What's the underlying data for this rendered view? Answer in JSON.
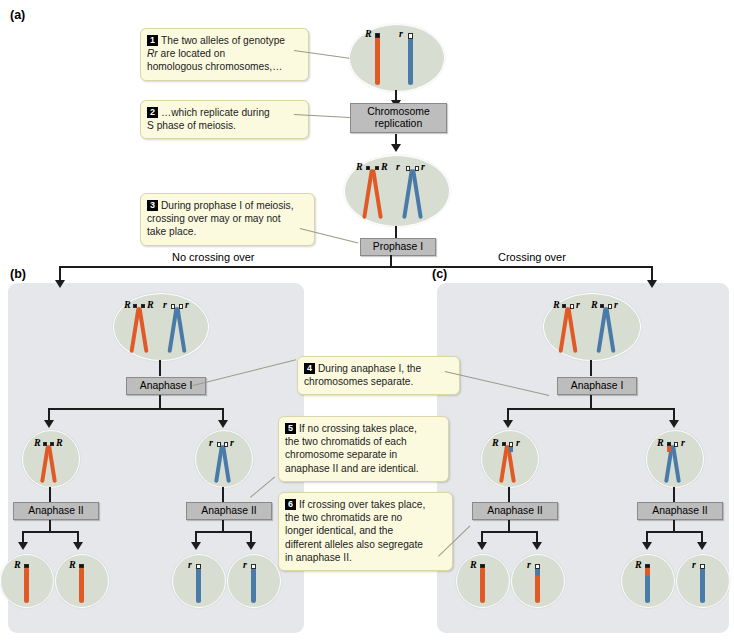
{
  "figure": {
    "sections": [
      {
        "id": "a",
        "label": "(a)"
      },
      {
        "id": "b",
        "label": "(b)"
      },
      {
        "id": "c",
        "label": "(c)"
      }
    ],
    "branch_labels": {
      "left": "No crossing over",
      "right": "Crossing over"
    },
    "stages": {
      "chromosome_replication": "Chromosome\nreplication",
      "chromosome_replication_line1": "Chromosome",
      "chromosome_replication_line2": "replication",
      "prophase_1": "Prophase I",
      "anaphase_1": "Anaphase I",
      "anaphase_2": "Anaphase II"
    },
    "callouts": [
      {
        "num": "1",
        "lines": [
          "The two alleles of genotype",
          "Rr are located on",
          "homologous chromosomes,…"
        ],
        "italic_token": "Rr"
      },
      {
        "num": "2",
        "lines": [
          "…which replicate during",
          "S phase of meiosis."
        ]
      },
      {
        "num": "3",
        "lines": [
          "During prophase I of meiosis,",
          "crossing over may or may not",
          "take place."
        ]
      },
      {
        "num": "4",
        "lines": [
          "During anaphase I, the",
          "chromosomes separate."
        ]
      },
      {
        "num": "5",
        "lines": [
          "If no crossing takes place,",
          "the two chromatids of each",
          "chromosome separate in",
          "anaphase II and are identical."
        ]
      },
      {
        "num": "6",
        "lines": [
          "If crossing over takes place,",
          "the two chromatids are no",
          "longer identical, and the",
          "different alleles also segregate",
          "in anaphase II."
        ]
      }
    ],
    "alleles": {
      "dominant": "R",
      "recessive": "r"
    },
    "colors": {
      "chromosome_orange": "#e05a28",
      "chromosome_blue": "#4a7ba8",
      "cell_fill": "#d7ddd0",
      "panel_fill": "#e6e7eb",
      "callout_fill": "#fbfadf",
      "stage_fill": "#bdbdbd",
      "allele_dominant_marker": "#111111",
      "allele_recessive_marker": "#ffffff"
    },
    "cell_labels": {
      "a_unreplicated": [
        "R",
        "r"
      ],
      "a_replicated": [
        "R",
        "R",
        "r",
        "r"
      ],
      "b_prophase": [
        "R",
        "R",
        "r",
        "r"
      ],
      "b_anaphase1_left": [
        "R",
        "R"
      ],
      "b_anaphase1_right": [
        "r",
        "r"
      ],
      "b_gametes": [
        "R",
        "R",
        "r",
        "r"
      ],
      "c_prophase": [
        "R",
        "r",
        "R",
        "r"
      ],
      "c_anaphase1_left": [
        "R",
        "r"
      ],
      "c_anaphase1_right": [
        "R",
        "r"
      ],
      "c_gametes": [
        "R",
        "r",
        "R",
        "r"
      ]
    }
  }
}
